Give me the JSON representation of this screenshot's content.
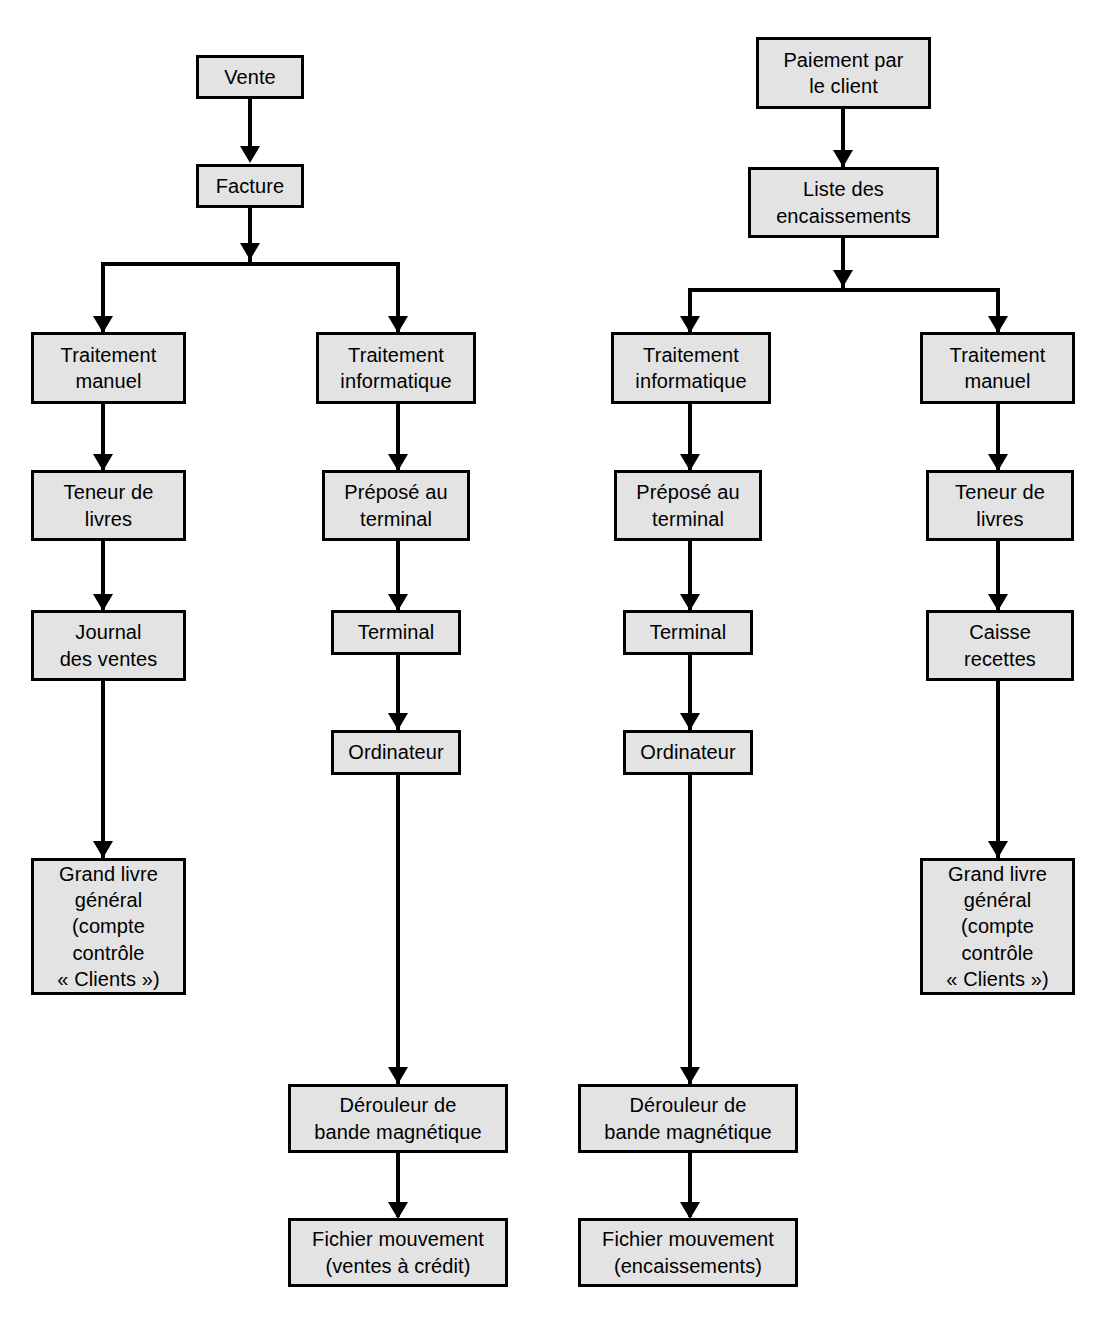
{
  "diagram": {
    "type": "flowchart",
    "background_color": "#ffffff",
    "node_fill_color": "#e3e3e3",
    "node_border_color": "#000000",
    "nodes": {
      "vente": "Vente",
      "facture": "Facture",
      "traitement_manuel_1": "Traitement\nmanuel",
      "teneur_livres_1": "Teneur de\nlivres",
      "journal_ventes": "Journal\ndes ventes",
      "grand_livre_1": "Grand livre\ngénéral\n(compte\ncontrôle\n« Clients »)",
      "traitement_info_1": "Traitement\ninformatique",
      "prepose_terminal_1": "Préposé au\nterminal",
      "terminal_1": "Terminal",
      "ordinateur_1": "Ordinateur",
      "derouleur_1": "Dérouleur de\nbande magnétique",
      "fichier_1": "Fichier mouvement\n(ventes à crédit)",
      "paiement_client": "Paiement par\nle client",
      "liste_encaissements": "Liste des\nencaissements",
      "traitement_info_2": "Traitement\ninformatique",
      "prepose_terminal_2": "Préposé au\nterminal",
      "terminal_2": "Terminal",
      "ordinateur_2": "Ordinateur",
      "derouleur_2": "Dérouleur de\nbande magnétique",
      "fichier_2": "Fichier mouvement\n(encaissements)",
      "traitement_manuel_2": "Traitement\nmanuel",
      "teneur_livres_2": "Teneur de\nlivres",
      "caisse_recettes": "Caisse\nrecettes",
      "grand_livre_2": "Grand livre\ngénéral\n(compte\ncontrôle\n« Clients »)"
    }
  }
}
